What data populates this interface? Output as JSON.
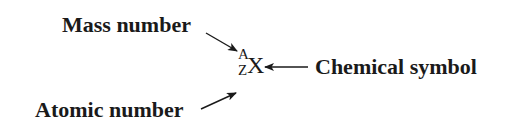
{
  "diagram": {
    "labels": {
      "mass_number": "Mass number",
      "atomic_number": "Atomic number",
      "chemical_symbol": "Chemical symbol"
    },
    "notation": {
      "mass_superscript": "A",
      "atomic_subscript": "Z",
      "symbol": "X"
    },
    "arrows": [
      {
        "from": "mass_number",
        "to": "mass_superscript"
      },
      {
        "from": "atomic_number",
        "to": "atomic_subscript"
      },
      {
        "from": "chemical_symbol",
        "to": "symbol"
      }
    ],
    "colors": {
      "text": "#1a1a1a",
      "background": "#ffffff"
    }
  }
}
